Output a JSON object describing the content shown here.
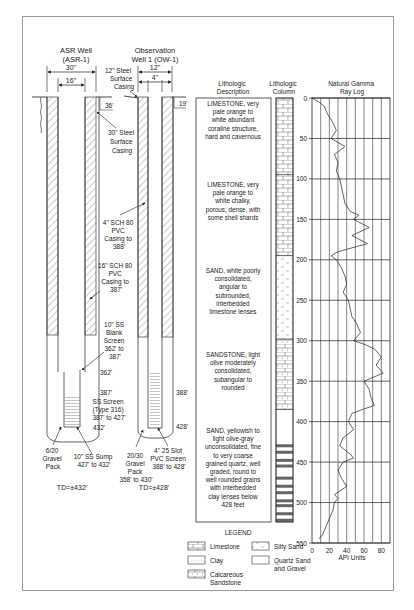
{
  "wells": {
    "asr": {
      "title_line1": "ASR Well",
      "title_line2": "(ASR-1)",
      "dim_outer": "30\"",
      "dim_inner": "16\"",
      "surface_depth": "36'",
      "labels": {
        "surface_casing": [
          "30\" Steel",
          "Surface",
          "Casing"
        ],
        "pvc_casing": [
          "16\" SCH 80",
          "PVC",
          "Casing to",
          "387'"
        ],
        "blank_screen": [
          "10\" SS",
          "Blank",
          "Screen",
          "362' to",
          "387'"
        ],
        "depth_362": "362'",
        "depth_387": "387'",
        "ss_screen": [
          "SS Screen",
          "(Type 316)",
          "387' to 427'"
        ],
        "depth_432": "432'",
        "gravel_pack": [
          "6/20",
          "Gravel",
          "Pack"
        ],
        "sump": [
          "10\" SS Sump",
          "427' to 432'"
        ],
        "td": "TD=±432'"
      }
    },
    "ow": {
      "title_line1": "Observation",
      "title_line2": "Well 1 (OW-1)",
      "dim_outer": "12\"",
      "dim_inner": "4\"",
      "surface_depth": "19'",
      "labels": {
        "surface_casing": [
          "12\" Steel",
          "Surface",
          "Casing"
        ],
        "pvc_casing": [
          "4\" SCH 80",
          "PVC",
          "Casing to",
          "388'"
        ],
        "depth_388": "388'",
        "depth_428": "428'",
        "gravel_pack": [
          "20/30",
          "Gravel",
          "Pack",
          "358' to 430'"
        ],
        "screen": [
          "4\" 25 Slot",
          "PVC Screen",
          "388' to 428'"
        ],
        "td": "TD=±428'"
      }
    }
  },
  "lithology": {
    "description_header": [
      "Lithologic",
      "Description"
    ],
    "column_header": [
      "Lithologic",
      "Column"
    ],
    "units": [
      {
        "name": "limestone-1",
        "lines": [
          "LIMESTONE, very",
          "pale orange to",
          "white abundant",
          "coraline structure,",
          "hard and cavernous"
        ],
        "pattern": "limestone",
        "top": 0,
        "bottom": 95
      },
      {
        "name": "limestone-2",
        "lines": [
          "LIMESTONE, very",
          "pale orange to",
          "white chalky,",
          "porous, dense, with",
          "some shell shards"
        ],
        "pattern": "limestone",
        "top": 95,
        "bottom": 195
      },
      {
        "name": "sand-1",
        "lines": [
          "SAND, white poorly",
          "consolidated,",
          "angular to",
          "subrounded,",
          "interbedded",
          "limestone lenses"
        ],
        "pattern": "silty-sand",
        "top": 195,
        "bottom": 298
      },
      {
        "name": "sandstone",
        "lines": [
          "SANDSTONE, light",
          "olive moderately",
          "consolidated,",
          "subangular to",
          "rounded"
        ],
        "pattern": "calcareous-sandstone",
        "top": 298,
        "bottom": 385
      },
      {
        "name": "sand-2",
        "lines": [
          "SAND, yellowish to",
          "light olive-gray",
          "unconsolidated, fine",
          "to very coarse",
          "grained quartz, well",
          "graded, round to",
          "well rounded grains",
          "with interbedded",
          "clay lenses below",
          "428 feet"
        ],
        "pattern": "quartz-sand-clay",
        "top": 385,
        "bottom": 545
      }
    ]
  },
  "chart_data": {
    "type": "line",
    "title": "Natural Gamma Ray Log",
    "xlabel": "API Units",
    "ylabel": "Depth (ft)",
    "xlim": [
      0,
      90
    ],
    "ylim": [
      550,
      0
    ],
    "x_ticks": [
      0,
      20,
      40,
      60,
      80
    ],
    "y_ticks": [
      0,
      50,
      100,
      150,
      200,
      250,
      300,
      350,
      400,
      450,
      500,
      550
    ],
    "grid": true,
    "series": [
      {
        "name": "Gamma",
        "depth": [
          0,
          5,
          10,
          20,
          30,
          40,
          50,
          55,
          60,
          70,
          80,
          90,
          100,
          110,
          120,
          130,
          140,
          145,
          150,
          160,
          170,
          180,
          190,
          195,
          200,
          210,
          220,
          230,
          240,
          250,
          260,
          270,
          280,
          290,
          300,
          305,
          310,
          320,
          330,
          340,
          350,
          360,
          370,
          380,
          385,
          390,
          400,
          410,
          420,
          430,
          440,
          445,
          450,
          460,
          470,
          480,
          490,
          495,
          500,
          510,
          520,
          530,
          540,
          545
        ],
        "api": [
          0,
          8,
          14,
          18,
          24,
          28,
          22,
          30,
          38,
          26,
          30,
          28,
          32,
          34,
          36,
          38,
          44,
          54,
          48,
          66,
          46,
          64,
          30,
          22,
          28,
          34,
          38,
          40,
          36,
          42,
          44,
          46,
          52,
          56,
          48,
          62,
          72,
          80,
          74,
          82,
          60,
          66,
          68,
          72,
          58,
          46,
          42,
          48,
          36,
          32,
          44,
          48,
          36,
          30,
          34,
          40,
          26,
          30,
          26,
          24,
          20,
          16,
          12,
          8
        ]
      }
    ]
  },
  "legend": {
    "title": "LEGEND",
    "items": [
      {
        "label": "Limestone",
        "pattern": "limestone"
      },
      {
        "label": "Clay",
        "pattern": "clay"
      },
      {
        "label": "Calcareous Sandstone",
        "lines": [
          "Calcareous",
          "Sandstone"
        ],
        "pattern": "calcareous-sandstone"
      },
      {
        "label": "Silty Sand",
        "pattern": "silty-sand"
      },
      {
        "label": "Quartz Sand and Gravel",
        "lines": [
          "Quartz Sand",
          "and Gravel"
        ],
        "pattern": "quartz-sand"
      }
    ]
  },
  "colors": {
    "line": "#222222",
    "hatch": "#555555",
    "frame": "#9a9a9a",
    "grid": "#333333"
  }
}
